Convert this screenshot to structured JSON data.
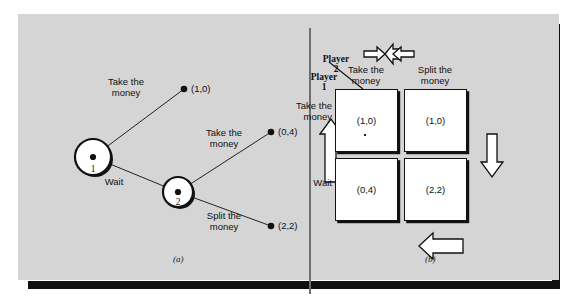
{
  "figure": {
    "background_color": "#d5d5d5",
    "shadow_color": "#111111",
    "panels": [
      {
        "caption": "(a)",
        "kind": "extensive-form-game-tree"
      },
      {
        "caption": "(b)",
        "kind": "normal-form-payoff-matrix"
      }
    ]
  },
  "tree": {
    "nodes": [
      {
        "id": "n1",
        "label": "1"
      },
      {
        "id": "n2",
        "label": "2"
      }
    ],
    "edges": [
      {
        "from": "1",
        "label": "Take the\nmoney",
        "label_line1": "Take the",
        "label_line2": "money"
      },
      {
        "from": "1",
        "label": "Wait",
        "label_line1": "Wait",
        "label_line2": ""
      },
      {
        "from": "2",
        "label": "Take the\nmoney",
        "label_line1": "Take the",
        "label_line2": "money"
      },
      {
        "from": "2",
        "label": "Split the\nmoney",
        "label_line1": "Split the",
        "label_line2": "money"
      }
    ],
    "terminals": [
      {
        "payoff": "(1,0)"
      },
      {
        "payoff": "(0,4)"
      },
      {
        "payoff": "(2,2)"
      }
    ]
  },
  "matrix": {
    "player_row_label_line1": "Player",
    "player_row_label_line2": "1",
    "player_col_label_line1": "Player",
    "player_col_label_line2": "2",
    "col_headers": [
      {
        "line1": "Take the",
        "line2": "money"
      },
      {
        "line1": "Split the",
        "line2": "money"
      }
    ],
    "row_headers": [
      {
        "line1": "Take the",
        "line2": "money"
      },
      {
        "line1": "Wait",
        "line2": ""
      }
    ],
    "cells": [
      [
        "(1,0)",
        "(1,0)"
      ],
      [
        "(0,4)",
        "(2,2)"
      ]
    ],
    "arrows": [
      {
        "name": "top-double-arrow",
        "direction": "left-right"
      },
      {
        "name": "right-arrow",
        "direction": "down"
      },
      {
        "name": "bottom-arrow",
        "direction": "left"
      },
      {
        "name": "left-arrow",
        "direction": "up"
      }
    ]
  }
}
